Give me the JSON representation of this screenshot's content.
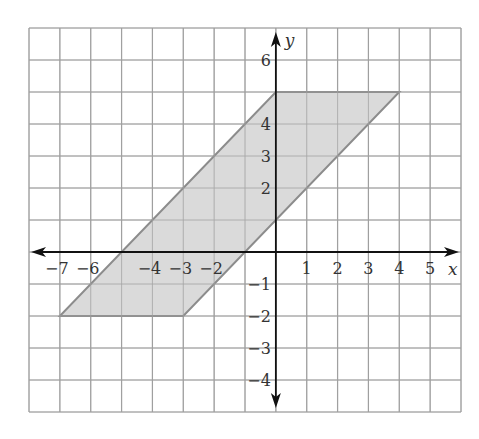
{
  "chart_data": {
    "type": "polygon",
    "title": "",
    "xlabel": "x",
    "ylabel": "y",
    "xlim": [
      -8,
      6
    ],
    "ylim": [
      -5,
      7
    ],
    "grid": true,
    "x_tick_labels": [
      -7,
      -6,
      -4,
      -3,
      -2,
      1,
      2,
      3,
      4,
      5
    ],
    "y_tick_labels": [
      6,
      4,
      3,
      2,
      -1,
      -2,
      -3,
      -4
    ],
    "shapes": [
      {
        "name": "parallelogram",
        "vertices": [
          [
            -7,
            -2
          ],
          [
            -3,
            -2
          ],
          [
            4,
            5
          ],
          [
            0,
            5
          ]
        ],
        "fill": "#d4d4d4",
        "stroke": "#8c8c8c"
      }
    ]
  },
  "colors": {
    "grid": "#a0a0a0",
    "axis": "#111111",
    "fill": "#d4d4d4",
    "outline": "#8c8c8c"
  }
}
